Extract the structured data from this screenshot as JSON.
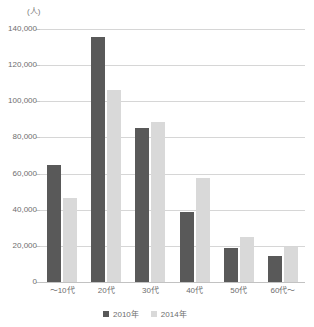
{
  "top_caption": "",
  "axis_unit_label": "(人)",
  "legend": {
    "position": "bottom-center",
    "items": [
      {
        "label": "2010年",
        "color": "#595959"
      },
      {
        "label": "2014年",
        "color": "#d9d9d9"
      }
    ]
  },
  "chart_data": {
    "type": "bar",
    "title": "",
    "subtitle": "",
    "xlabel": "",
    "ylabel": "(人)",
    "ylim": [
      0,
      140000
    ],
    "ytick_values": [
      0,
      20000,
      40000,
      60000,
      80000,
      100000,
      120000,
      140000
    ],
    "ytick_labels": [
      "0",
      "20,000",
      "40,000",
      "60,000",
      "80,000",
      "100,000",
      "120,000",
      "140,000"
    ],
    "grid": true,
    "categories": [
      "～10代",
      "20代",
      "30代",
      "40代",
      "50代",
      "60代～"
    ],
    "series": [
      {
        "name": "2010年",
        "color": "#595959",
        "values": [
          64700,
          135600,
          85200,
          38700,
          18800,
          14400
        ]
      },
      {
        "name": "2014年",
        "color": "#d9d9d9",
        "values": [
          46500,
          106300,
          88500,
          57500,
          24900,
          19400
        ]
      }
    ]
  }
}
